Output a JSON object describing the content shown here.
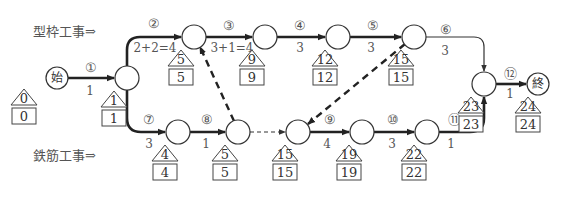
{
  "labels": {
    "formwork": "型枠工事⇒",
    "rebar": "鉄筋工事⇒"
  },
  "nodes": [
    {
      "id": "start",
      "text": "始",
      "est": "0",
      "lst": "0"
    },
    {
      "id": "n1",
      "text": "",
      "est": "1",
      "lst": "1"
    },
    {
      "id": "n2",
      "text": "",
      "est": "5",
      "lst": "5"
    },
    {
      "id": "n3",
      "text": "",
      "est": "9",
      "lst": "9"
    },
    {
      "id": "n4",
      "text": "",
      "est": "12",
      "lst": "12"
    },
    {
      "id": "n5",
      "text": "",
      "est": "15",
      "lst": "15"
    },
    {
      "id": "n7",
      "text": "",
      "est": "4",
      "lst": "4"
    },
    {
      "id": "n8",
      "text": "",
      "est": "5",
      "lst": "5"
    },
    {
      "id": "n9",
      "text": "",
      "est": "15",
      "lst": "15"
    },
    {
      "id": "n10",
      "text": "",
      "est": "19",
      "lst": "19"
    },
    {
      "id": "n11",
      "text": "",
      "est": "22",
      "lst": "22"
    },
    {
      "id": "n12",
      "text": "",
      "est": "23",
      "lst": "23"
    },
    {
      "id": "end",
      "text": "終",
      "est": "24",
      "lst": "24"
    }
  ],
  "activities": [
    {
      "num": "①",
      "duration": "1",
      "from": "start",
      "to": "n1",
      "style": "bold"
    },
    {
      "num": "②",
      "duration": "2+2=4",
      "from": "n1",
      "to": "n2",
      "style": "bold"
    },
    {
      "num": "③",
      "duration": "3+1=4",
      "from": "n2",
      "to": "n3",
      "style": "bold"
    },
    {
      "num": "④",
      "duration": "3",
      "from": "n3",
      "to": "n4",
      "style": "bold"
    },
    {
      "num": "⑤",
      "duration": "3",
      "from": "n4",
      "to": "n5",
      "style": "bold"
    },
    {
      "num": "⑥",
      "duration": "3",
      "from": "n5",
      "to": "n12",
      "style": "thin"
    },
    {
      "num": "⑦",
      "duration": "3",
      "from": "n1",
      "to": "n7",
      "style": "bold"
    },
    {
      "num": "⑧",
      "duration": "1",
      "from": "n7",
      "to": "n8",
      "style": "bold"
    },
    {
      "num": "⑨",
      "duration": "4",
      "from": "n9",
      "to": "n10",
      "style": "bold"
    },
    {
      "num": "⑩",
      "duration": "3",
      "from": "n10",
      "to": "n11",
      "style": "bold"
    },
    {
      "num": "⑪",
      "duration": "1",
      "from": "n11",
      "to": "n12",
      "style": "bold"
    },
    {
      "num": "⑫",
      "duration": "1",
      "from": "n12",
      "to": "end",
      "style": "bold"
    }
  ],
  "dummies": [
    {
      "from": "n8",
      "to": "n2",
      "style": "bold-dashed"
    },
    {
      "from": "n5",
      "to": "n9",
      "style": "bold-dashed"
    },
    {
      "from": "n8",
      "to": "n9",
      "style": "thin-dashed"
    }
  ]
}
